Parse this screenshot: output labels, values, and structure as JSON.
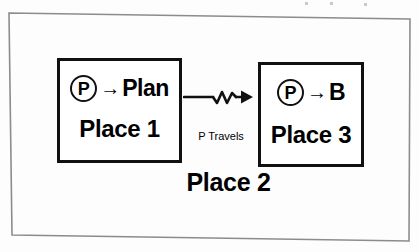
{
  "figure": {
    "title": "Place 2",
    "background_color": "#fdfdfd",
    "ink_color": "#111111"
  },
  "boxes": [
    {
      "id": "place1",
      "token": "P",
      "arrow": "→",
      "target": "Plan",
      "place_label": "Place 1"
    },
    {
      "id": "place3",
      "token": "P",
      "arrow": "→",
      "target": "B",
      "place_label": "Place 3"
    }
  ],
  "connector": {
    "label": "P Travels",
    "style": "squiggle-arrow",
    "direction": "left-to-right"
  },
  "icons": {
    "token_circle": "circled-p-icon",
    "arrow": "right-arrow-icon",
    "squiggle": "squiggle-arrow-icon"
  }
}
